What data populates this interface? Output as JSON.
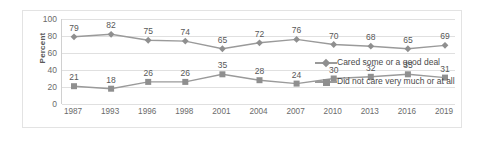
{
  "chart_data": {
    "type": "line",
    "title": "",
    "xlabel": "",
    "ylabel": "Percent",
    "ylim": [
      0,
      100
    ],
    "ytick_step": 20,
    "yticks": [
      100,
      80,
      60,
      40,
      20,
      0
    ],
    "grid": true,
    "legend_position": "right",
    "categories": [
      "1987",
      "1993",
      "1996",
      "1998",
      "2001",
      "2004",
      "2007",
      "2010",
      "2013",
      "2016",
      "2019"
    ],
    "series": [
      {
        "name": "Cared some or a good deal",
        "marker": "diamond",
        "color": "#8f8f8f",
        "values": [
          79,
          82,
          75,
          74,
          65,
          72,
          76,
          70,
          68,
          65,
          69
        ]
      },
      {
        "name": "Did not care very much or at all",
        "marker": "square",
        "color": "#8f8f8f",
        "values": [
          21,
          18,
          26,
          26,
          35,
          28,
          24,
          30,
          32,
          35,
          31
        ]
      }
    ]
  },
  "colors": {
    "line": "#9a9a9a",
    "marker": "#8f8f8f",
    "gridline": "#e0e0e0",
    "axis": "#d0d0d0",
    "frame_border": "#e3e3e3",
    "label_text": "#585858",
    "tick_text": "#6b6b6b"
  }
}
